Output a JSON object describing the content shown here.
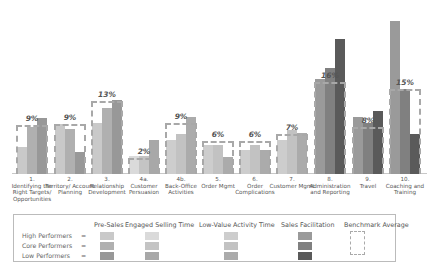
{
  "chart_data": {
    "type": "bar",
    "title": "",
    "xlabel": "",
    "ylabel": "",
    "categories": [
      "1. Identifying the Right Targets/ Opportunities",
      "2. Territory/ Account Planning",
      "3. Relationship Development",
      "4a. Customer Persuasion",
      "4b. Back-Office Activities",
      "5. Order Mgmt",
      "6. Order Complications",
      "7. Customer Mgmt",
      "8. Administration and Reporting",
      "9. Travel",
      "10. Coaching and Training"
    ],
    "benchmark_average_pct": [
      "9%",
      "9%",
      "13%",
      "2%",
      "9%",
      "6%",
      "6%",
      "7%",
      "16%",
      "8%",
      "15%"
    ],
    "series": [
      {
        "name": "High Performers",
        "values": [
          8.5,
          15.1,
          16.4,
          5.6,
          10.7,
          9.8,
          7.6,
          10.4,
          29.5,
          17.1,
          47.6
        ]
      },
      {
        "name": "Core Performers",
        "values": [
          13.6,
          14.0,
          21.0,
          5.6,
          12.4,
          9.8,
          9.6,
          13.1,
          32.7,
          15.3,
          26.4
        ]
      },
      {
        "name": "Low Performers",
        "values": [
          16.4,
          7.6,
          23.3,
          10.0,
          17.3,
          6.0,
          8.2,
          12.2,
          41.7,
          18.8,
          12.7
        ]
      }
    ],
    "benchmark_values": [
      9,
      9,
      13,
      2,
      9,
      6,
      6,
      7,
      16,
      8,
      15
    ],
    "activity_category": [
      "Pre-Sales",
      "Pre-Sales",
      "Pre-Sales",
      "Engaged Selling Time",
      "Low-Value Activity Time",
      "Low-Value Activity Time",
      "Low-Value Activity Time",
      "Low-Value Activity Time",
      "Sales Facilitation",
      "Sales Facilitation",
      "Sales Facilitation"
    ],
    "grid": false,
    "legend_position": "bottom",
    "units": "% of time (estimated)"
  },
  "groups": [
    {
      "label_num": "1.",
      "label": "Identifying the Right Targets/ Opportunities",
      "pct": "9%",
      "x": 17,
      "bench_top": 125,
      "bars": [
        147,
        127,
        118
      ],
      "colors": [
        "#c9c9c9",
        "#b0b0b0",
        "#989898"
      ]
    },
    {
      "label_num": "2.",
      "label": "Territory/ Account Planning",
      "pct": "9%",
      "x": 55,
      "bench_top": 124,
      "bars": [
        124,
        129,
        152
      ],
      "colors": [
        "#c9c9c9",
        "#b0b0b0",
        "#989898"
      ]
    },
    {
      "label_num": "3.",
      "label": "Relationship Development",
      "pct": "13%",
      "x": 92,
      "bench_top": 101,
      "bars": [
        123,
        108,
        100
      ],
      "colors": [
        "#c9c9c9",
        "#b0b0b0",
        "#989898"
      ]
    },
    {
      "label_num": "4a.",
      "label": "Customer Persuasion",
      "pct": "2%",
      "x": 129,
      "bench_top": 158,
      "bars": [
        156,
        156,
        140
      ],
      "colors": [
        "#dadada",
        "#c4c4c4",
        "#a8a8a8"
      ]
    },
    {
      "label_num": "4b.",
      "label": "Back-Office Activities",
      "pct": "9%",
      "x": 166,
      "bench_top": 123,
      "bars": [
        140,
        134,
        117
      ],
      "colors": [
        "#cdcdcd",
        "#c2c2c2",
        "#ababab"
      ]
    },
    {
      "label_num": "5.",
      "label": "Order Mgmt",
      "pct": "6%",
      "x": 203,
      "bench_top": 141,
      "bars": [
        145,
        145,
        157
      ],
      "colors": [
        "#cdcdcd",
        "#c2c2c2",
        "#ababab"
      ]
    },
    {
      "label_num": "6.",
      "label": "Order Complications",
      "pct": "6%",
      "x": 240,
      "bench_top": 141,
      "bars": [
        150,
        145,
        150
      ],
      "colors": [
        "#cdcdcd",
        "#c2c2c2",
        "#ababab"
      ]
    },
    {
      "label_num": "7.",
      "label": "Customer Mgmt",
      "pct": "7%",
      "x": 277,
      "bench_top": 134,
      "bars": [
        140,
        130,
        133
      ],
      "colors": [
        "#cdcdcd",
        "#c2c2c2",
        "#ababab"
      ]
    },
    {
      "label_num": "8.",
      "label": "Administration and Reporting",
      "pct": "16%",
      "x": 315,
      "bench_top": 82,
      "bars": [
        79,
        68,
        39
      ],
      "colors": [
        "#9a9a9a",
        "#808080",
        "#5a5a5a"
      ]
    },
    {
      "label_num": "9.",
      "label": "Travel",
      "pct": "8%",
      "x": 353,
      "bench_top": 127,
      "bars": [
        117,
        123,
        111
      ],
      "colors": [
        "#9a9a9a",
        "#808080",
        "#5a5a5a"
      ]
    },
    {
      "label_num": "10.",
      "label": "Coaching and Training",
      "pct": "15%",
      "x": 390,
      "bench_top": 89,
      "bars": [
        21,
        89,
        134
      ],
      "colors": [
        "#9a9a9a",
        "#808080",
        "#5a5a5a"
      ]
    }
  ],
  "legend": {
    "headers": [
      "Pre-Sales",
      "Engaged Selling Time",
      "Low-Value Activity Time",
      "Sales Facilitation",
      "Benchmark Average"
    ],
    "rows": [
      "High Performers",
      "Core Performers",
      "Low Performers"
    ],
    "equals": "=",
    "colors": {
      "pre_sales": [
        "#c9c9c9",
        "#b0b0b0",
        "#989898"
      ],
      "engaged_selling": [
        "#dadada",
        "#c4c4c4",
        "#a8a8a8"
      ],
      "low_value": [
        "#cdcdcd",
        "#c2c2c2",
        "#ababab"
      ],
      "sales_facilitation": [
        "#9a9a9a",
        "#808080",
        "#5a5a5a"
      ]
    }
  }
}
